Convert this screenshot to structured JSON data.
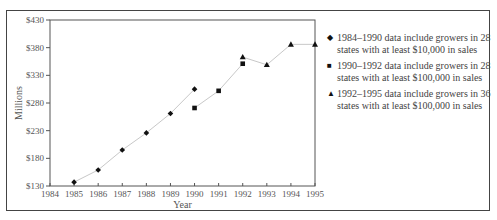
{
  "chart_data": {
    "type": "line",
    "title": "",
    "xlabel": "Year",
    "ylabel": "Millions",
    "xlim": [
      1984,
      1995
    ],
    "ylim": [
      130,
      430
    ],
    "x_ticks": [
      "1984",
      "1985",
      "1986",
      "1987",
      "1988",
      "1989",
      "1990",
      "1991",
      "1992",
      "1993",
      "1994",
      "1995"
    ],
    "y_ticks": [
      "$130",
      "$180",
      "$230",
      "$280",
      "$330",
      "$380",
      "$430"
    ],
    "grid": false,
    "legend_position": "right",
    "series": [
      {
        "name": "1984–1990 data include growers in 28 states with at least $10,000 in sales",
        "marker": "diamond",
        "x": [
          1985,
          1986,
          1987,
          1988,
          1989,
          1990
        ],
        "values": [
          137,
          159,
          195,
          226,
          261,
          305
        ]
      },
      {
        "name": "1990–1992 data include growers in 28 states with at least $100,000 in sales",
        "marker": "square",
        "x": [
          1990,
          1991,
          1992
        ],
        "values": [
          271,
          302,
          351
        ]
      },
      {
        "name": "1992–1995 data include growers in 36 states with at least $100,000 in sales",
        "marker": "triangle",
        "x": [
          1992,
          1993,
          1994,
          1995
        ],
        "values": [
          363,
          349,
          386,
          386
        ]
      }
    ]
  },
  "axis": {
    "xlabel": "Year",
    "ylabel": "Millions"
  },
  "legend": [
    {
      "marker": "◆",
      "line1": "1984–1990 data include growers in 28",
      "line2": "states with at least $10,000 in sales"
    },
    {
      "marker": "■",
      "line1": "1990–1992 data include growers in 28",
      "line2": "states with at least $100,000 in sales"
    },
    {
      "marker": "▲",
      "line1": "1992–1995 data include growers in 36",
      "line2": "states with at least $100,000 in sales"
    }
  ],
  "colors": {
    "line": "#c8c8c8",
    "marker": "#111111",
    "axis": "#555555",
    "frame": "#444444"
  }
}
